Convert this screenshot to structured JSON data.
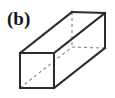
{
  "figure": {
    "panel_label": "(b)",
    "caption_text": "",
    "shape_name": "rectangular-cuboid",
    "projection": "oblique",
    "background_color": "#ffffff",
    "solid_edge_color": "#2b2b2b",
    "hidden_edge_color": "#8c8c8c",
    "solid_edge_width": 2,
    "hidden_edge_width": 1.2,
    "hidden_edge_dash": "3 3",
    "vertices": {
      "front_top_left": [
        20,
        53
      ],
      "front_top_right": [
        54,
        53
      ],
      "front_bottom_right": [
        54,
        88
      ],
      "front_bottom_left": [
        20,
        88
      ],
      "back_top_left": [
        72,
        12
      ],
      "back_top_right": [
        105,
        13
      ],
      "back_bottom_right": [
        105,
        48
      ],
      "back_bottom_left_hidden": [
        72,
        47
      ]
    },
    "solid_edges": [
      "front-top-left to front-top-right",
      "front-top-right to front-bottom-right",
      "front-bottom-right to front-bottom-left",
      "front-bottom-left to front-top-left",
      "back-top-left to back-top-right",
      "back-top-right to back-bottom-right",
      "front-top-left to back-top-left",
      "front-top-right to back-top-right",
      "front-bottom-right to back-bottom-right"
    ],
    "hidden_edges": [
      "back-top-left to back-bottom-left-hidden",
      "back-bottom-left-hidden to back-bottom-right",
      "front-bottom-left to back-bottom-left-hidden"
    ]
  }
}
